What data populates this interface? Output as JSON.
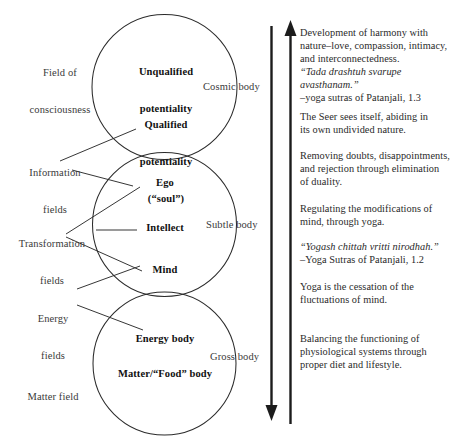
{
  "diagram": {
    "field_labels": [
      {
        "id": "field-of-consciousness",
        "line1": "Field of",
        "line2": "consciousness"
      },
      {
        "id": "information-fields",
        "line1": "Information",
        "line2": "fields"
      },
      {
        "id": "transformation-fields",
        "line1": "Transformation",
        "line2": "fields"
      },
      {
        "id": "energy-fields",
        "line1": "Energy",
        "line2": "fields"
      },
      {
        "id": "matter-field",
        "line1": "Matter field",
        "line2": ""
      }
    ],
    "circles": [
      {
        "id": "cosmic-body",
        "body_label": "Cosmic body",
        "inner_labels": [
          {
            "id": "unqualified-potentiality",
            "line1": "Unqualified",
            "line2": "potentiality"
          },
          {
            "id": "qualified-potentiality",
            "line1": "Qualified",
            "line2": "potentiality",
            "line3": "(“soul”)"
          }
        ]
      },
      {
        "id": "subtle-body",
        "body_label": "Subtle body",
        "inner_labels": [
          {
            "id": "ego",
            "line1": "Ego"
          },
          {
            "id": "intellect",
            "line1": "Intellect"
          },
          {
            "id": "mind",
            "line1": "Mind"
          }
        ]
      },
      {
        "id": "gross-body",
        "body_label": "Gross body",
        "inner_labels": [
          {
            "id": "energy-body",
            "line1": "Energy body"
          },
          {
            "id": "matter-food-body",
            "line1": "Matter/“Food” body"
          }
        ]
      }
    ],
    "arrows": [
      {
        "id": "downward-arrow",
        "direction": "down"
      },
      {
        "id": "upward-arrow",
        "direction": "up"
      }
    ],
    "notes": [
      {
        "id": "note-harmony",
        "lines": [
          {
            "text": "Development of harmony with",
            "style": "plain"
          },
          {
            "text": "nature–love, compassion, intimacy,",
            "style": "plain"
          },
          {
            "text": "and interconnectedness.",
            "style": "plain"
          },
          {
            "text": "“Tada drashtuh svarupe",
            "style": "sanskrit"
          },
          {
            "text": "avasthanam.”",
            "style": "sanskrit"
          },
          {
            "text": "–yoga sutras of Patanjali, 1.3",
            "style": "cite"
          }
        ]
      },
      {
        "id": "note-seer",
        "lines": [
          {
            "text": "The Seer sees itself, abiding in",
            "style": "plain"
          },
          {
            "text": "its own undivided nature.",
            "style": "plain"
          }
        ]
      },
      {
        "id": "note-doubts",
        "lines": [
          {
            "text": "Removing doubts, disappointments,",
            "style": "plain"
          },
          {
            "text": "and rejection through elimination",
            "style": "plain"
          },
          {
            "text": "of duality.",
            "style": "plain"
          }
        ]
      },
      {
        "id": "note-regulating",
        "lines": [
          {
            "text": "Regulating the modifications of",
            "style": "plain"
          },
          {
            "text": "mind, through yoga.",
            "style": "plain"
          }
        ]
      },
      {
        "id": "note-yogash",
        "lines": [
          {
            "text": "“Yogash chittah vritti nirodhah.”",
            "style": "sanskrit"
          },
          {
            "text": "–Yoga Sutras of Patanjali, 1.2",
            "style": "cite"
          }
        ]
      },
      {
        "id": "note-cessation",
        "lines": [
          {
            "text": "Yoga is the cessation of the",
            "style": "plain"
          },
          {
            "text": "fluctuations of mind.",
            "style": "plain"
          }
        ]
      },
      {
        "id": "note-balancing",
        "lines": [
          {
            "text": "Balancing the functioning of",
            "style": "plain"
          },
          {
            "text": "physiological systems through",
            "style": "plain"
          },
          {
            "text": "proper diet and lifestyle.",
            "style": "plain"
          }
        ]
      }
    ],
    "colors": {
      "stroke": "#2b2b2b",
      "text": "#2a2a2a",
      "background": "#ffffff"
    }
  }
}
